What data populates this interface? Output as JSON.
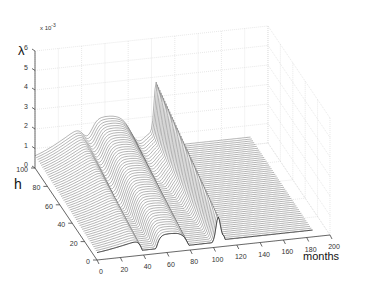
{
  "chart_data": {
    "type": "surface3d",
    "title": "",
    "zlabel": "λ",
    "zscale_label": "x 10",
    "zscale_exp": "-3",
    "ylabel": "h",
    "xlabel": "months",
    "z_ticks": [
      "0",
      "1",
      "2",
      "3",
      "4",
      "5",
      "6"
    ],
    "y_ticks": [
      "0",
      "20",
      "40",
      "60",
      "80",
      "100"
    ],
    "x_ticks": [
      "0",
      "20",
      "40",
      "60",
      "80",
      "100",
      "120",
      "140",
      "160",
      "180",
      "200"
    ],
    "xlim": [
      0,
      200
    ],
    "ylim": [
      0,
      100
    ],
    "zlim": [
      0,
      6
    ],
    "grid": true,
    "legend": null,
    "key_features": [
      {
        "months": 60,
        "h": 100,
        "lambda_e3": 2.0,
        "note": "broad maximum of hump"
      },
      {
        "months": 45,
        "h": 30,
        "lambda_e3": 0.0,
        "note": "deep valley"
      },
      {
        "months": 90,
        "h": 20,
        "lambda_e3": 0.0,
        "note": "deep valley"
      },
      {
        "months": 105,
        "h": 100,
        "lambda_e3": 2.8,
        "note": "sharp spike"
      },
      {
        "months": 150,
        "h": 50,
        "lambda_e3": 0.3,
        "note": "flat plateau"
      }
    ]
  }
}
